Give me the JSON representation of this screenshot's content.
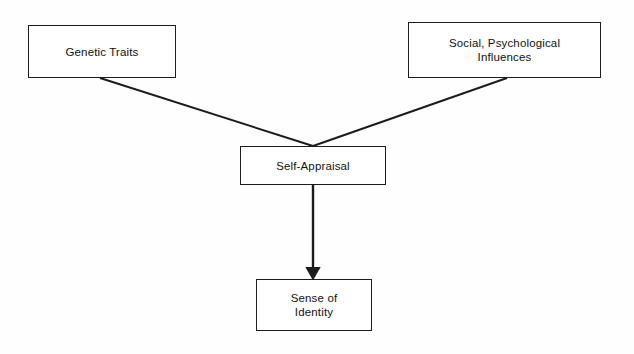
{
  "diagram": {
    "background_color": "#fefefe",
    "line_color": "#1c1c1c",
    "text_color": "#121212",
    "nodes": {
      "genetic_traits": {
        "label": "Genetic Traits"
      },
      "social_influences": {
        "label": "Social, Psychological\nInfluences"
      },
      "self_appraisal": {
        "label": "Self-Appraisal"
      },
      "sense_of_identity": {
        "label": "Sense of\nIdentity"
      }
    },
    "connectors": [
      {
        "name": "genetic-traits-to-self-appraisal",
        "from": "genetic_traits",
        "to": "self_appraisal",
        "style": "plain-line",
        "arrowhead": false
      },
      {
        "name": "social-influences-to-self-appraisal",
        "from": "social_influences",
        "to": "self_appraisal",
        "style": "plain-line",
        "arrowhead": false
      },
      {
        "name": "self-appraisal-to-sense-of-identity",
        "from": "self_appraisal",
        "to": "sense_of_identity",
        "style": "arrow",
        "arrowhead": true
      }
    ]
  }
}
